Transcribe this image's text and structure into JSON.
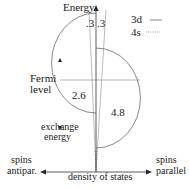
{
  "diagram": {
    "axis_y_label": "Energy",
    "axis_x_label": "density of states",
    "left_label_line1": "spins",
    "left_label_line2": "antipar.",
    "right_label_line1": "spins",
    "right_label_line2": "parallel",
    "fermi_label_line1": "Fermi",
    "fermi_label_line2": "level",
    "exchange_label_line1": "exchange",
    "exchange_label_line2": "energy",
    "value_left_4s": ".3",
    "value_right_4s": ".3",
    "value_left_3d": "2.6",
    "value_right_3d": "4.8",
    "legend": [
      {
        "label": "3d",
        "style": "solid"
      },
      {
        "label": "4s",
        "style": "dotted"
      }
    ],
    "colors": {
      "line": "#555555",
      "text": "#222222"
    }
  }
}
